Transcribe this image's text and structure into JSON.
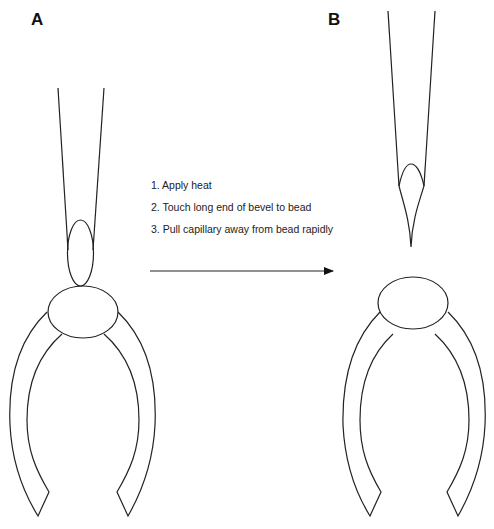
{
  "panels": {
    "a": {
      "label": "A"
    },
    "b": {
      "label": "B"
    }
  },
  "steps": [
    "1. Apply heat",
    "2. Touch long end of bevel to bead",
    "3. Pull capillary away from bead rapidly"
  ],
  "colors": {
    "stroke": "#222222",
    "background": "#ffffff"
  }
}
